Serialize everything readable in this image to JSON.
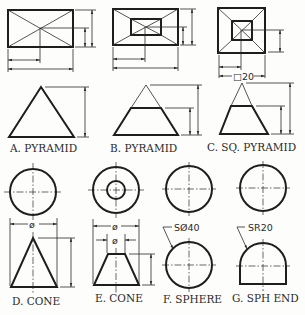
{
  "figures": [
    {
      "id": "A",
      "label": "A. PYRAMID"
    },
    {
      "id": "B",
      "label": "B. PYRAMID"
    },
    {
      "id": "C",
      "label": "C. SQ. PYRAMID",
      "dimension": "□20"
    },
    {
      "id": "D",
      "label": "D. CONE",
      "dimension": "ø"
    },
    {
      "id": "E",
      "label": "E. CONE",
      "dimension_outer": "ø",
      "dimension_inner": "ø"
    },
    {
      "id": "F",
      "label": "F. SPHERE",
      "dimension": "SØ40"
    },
    {
      "id": "G",
      "label": "G. SPH END",
      "dimension": "SR20"
    }
  ]
}
